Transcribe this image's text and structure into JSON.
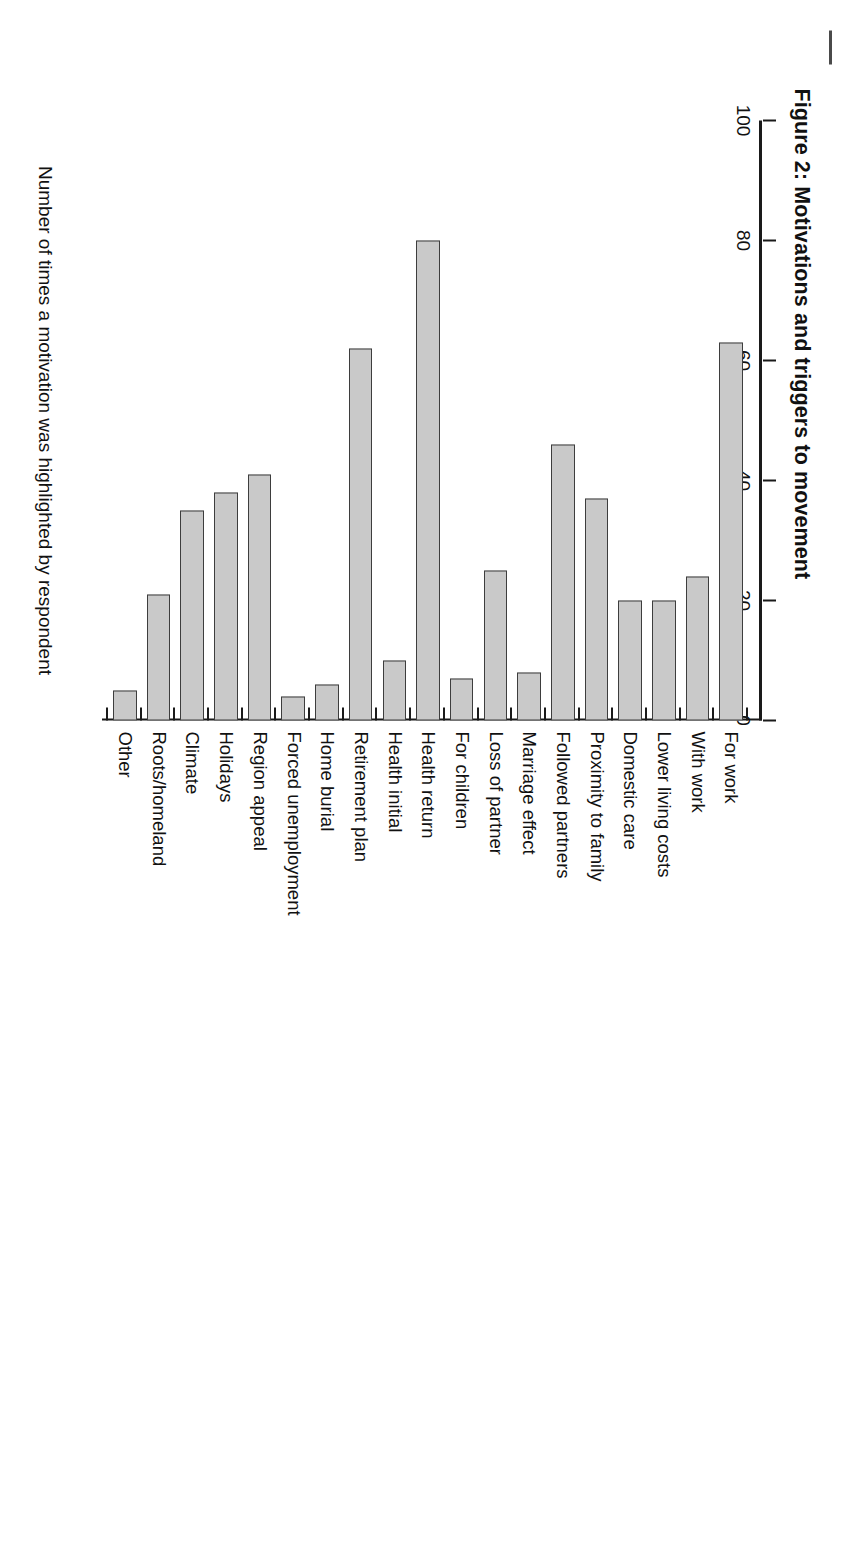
{
  "figure": {
    "title": "Figure 2: Motivations and triggers to movement"
  },
  "chart_data": {
    "type": "bar",
    "orientation": "horizontal",
    "title": "Figure 2: Motivations and triggers to movement",
    "xlabel": "Number of times a motivation was highlighted by respondent",
    "ylabel": "",
    "xlim": [
      0,
      100
    ],
    "xticks": [
      0,
      20,
      40,
      60,
      80,
      100
    ],
    "xtick_labels": [
      "0",
      "20",
      "40",
      "60",
      "80",
      "100"
    ],
    "grid": false,
    "legend": false,
    "bar_color": "#c9c9c9",
    "bar_edge_color": "#3d3d3d",
    "categories": [
      "For work",
      "With work",
      "Lower living costs",
      "Domestic care",
      "Proximity to family",
      "Followed partners",
      "Marriage effect",
      "Loss of partner",
      "For children",
      "Health return",
      "Health initial",
      "Retirement plan",
      "Home burial",
      "Forced unemployment",
      "Region appeal",
      "Holidays",
      "Climate",
      "Roots/homeland",
      "Other"
    ],
    "values": [
      63,
      24,
      20,
      20,
      37,
      46,
      8,
      25,
      7,
      80,
      10,
      62,
      6,
      4,
      41,
      38,
      35,
      21,
      5
    ]
  }
}
